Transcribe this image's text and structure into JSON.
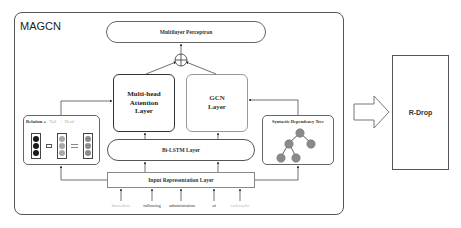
{
  "model": {
    "title": "MAGCN",
    "multilayer_perceptron": "Multilayer Perceptron",
    "multihead_attention": "Multi-head\nAttention\nLayer",
    "gcn_layer": "GCN\nLayer",
    "bilstm": "Bi-LSTM Layer",
    "input_representation": "Input Representation Layer",
    "relation_panel": {
      "relation_label": "Relation",
      "operator_eq": "=",
      "tail_label": "Tail",
      "operator_minus": "-",
      "head_label": "Head",
      "colors": {
        "relation": "#1a1a1a",
        "tail": "#a8a8a8",
        "head": "#8c8c8c"
      }
    },
    "dependency_tree": {
      "title": "Syntactic Dependency Tree",
      "node_color": "#8a8a8a"
    },
    "input_words": [
      {
        "text": "Immediate",
        "faded": true
      },
      {
        "text": "following",
        "faded": false
      },
      {
        "text": "administration",
        "faded": false
      },
      {
        "text": "of",
        "faded": false
      },
      {
        "text": "carboxylic",
        "faded": true
      }
    ]
  },
  "rdrop": {
    "label": "R-Drop"
  }
}
